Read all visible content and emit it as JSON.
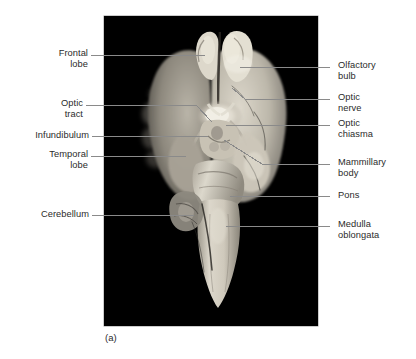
{
  "figure": {
    "caption": "(a)",
    "view_description": "Ventral (inferior) view of a preserved mammalian brain specimen",
    "panel_background": "#000000",
    "page_background": "#ffffff",
    "leader_color": "#8a8a8a",
    "text_color": "#2b2b2b"
  },
  "labels": {
    "left": [
      {
        "id": "frontal-lobe",
        "lines": [
          "Frontal",
          "lobe"
        ]
      },
      {
        "id": "optic-tract",
        "lines": [
          "Optic",
          "tract"
        ]
      },
      {
        "id": "infundibulum",
        "lines": [
          "Infundibulum"
        ]
      },
      {
        "id": "temporal-lobe",
        "lines": [
          "Temporal",
          "lobe"
        ]
      },
      {
        "id": "cerebellum",
        "lines": [
          "Cerebellum"
        ]
      }
    ],
    "right": [
      {
        "id": "olfactory-bulb",
        "lines": [
          "Olfactory",
          "bulb"
        ]
      },
      {
        "id": "optic-nerve",
        "lines": [
          "Optic",
          "nerve"
        ]
      },
      {
        "id": "optic-chiasma",
        "lines": [
          "Optic",
          "chiasma"
        ]
      },
      {
        "id": "mammillary-body",
        "lines": [
          "Mammillary",
          "body"
        ]
      },
      {
        "id": "pons",
        "lines": [
          "Pons"
        ]
      },
      {
        "id": "medulla-oblongata",
        "lines": [
          "Medulla",
          "oblongata"
        ]
      }
    ]
  }
}
